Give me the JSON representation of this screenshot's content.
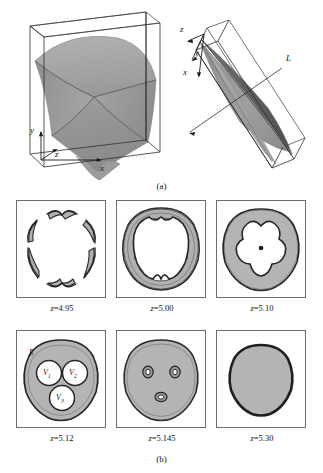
{
  "figure": {
    "panels": [
      {
        "id": "panel-a",
        "caption": "(a)"
      },
      {
        "id": "panel-b",
        "caption": "(b)"
      }
    ]
  },
  "panel_a": {
    "caption": "(a)",
    "left_render": {
      "name": "three-dimensional-surface-box-left",
      "axes": [
        {
          "label": "y",
          "direction": "up"
        },
        {
          "label": "z",
          "direction": "depth"
        },
        {
          "label": "x",
          "direction": "right"
        }
      ]
    },
    "right_render": {
      "name": "three-dimensional-surface-box-right",
      "axes": [
        {
          "label": "z",
          "direction": "up"
        },
        {
          "label": "y",
          "direction": "depth"
        },
        {
          "label": "x",
          "direction": "down"
        }
      ],
      "annotations": [
        {
          "label": "L",
          "name": "line-L"
        }
      ]
    }
  },
  "panel_b": {
    "caption": "(b)",
    "cross_sections": [
      {
        "id": "cs-1",
        "z_prefix": "z",
        "z_value": "=4.95",
        "label": "z=4.95",
        "description": "six separate crescent arcs arranged around a circle"
      },
      {
        "id": "cs-2",
        "z_prefix": "z",
        "z_value": "=5.00",
        "label": "z=5.00",
        "description": "connected annular ring with trilobal inner boundary"
      },
      {
        "id": "cs-3",
        "z_prefix": "z",
        "z_value": "=5.10",
        "label": "z=5.10",
        "description": "thick annulus with trefoil inner hole and central point"
      },
      {
        "id": "cs-4",
        "z_prefix": "z",
        "z_value": "=5.12",
        "label": "z=5.12",
        "description": "filled shield region with three circular voids",
        "regions": [
          {
            "label": "E",
            "name": "region-E"
          },
          {
            "label": "V",
            "sub": "1",
            "name": "region-V1"
          },
          {
            "label": "V",
            "sub": "2",
            "name": "region-V2"
          },
          {
            "label": "V",
            "sub": "3",
            "name": "region-V3"
          }
        ]
      },
      {
        "id": "cs-5",
        "z_prefix": "z",
        "z_value": "=5.145",
        "label": "z=5.145",
        "description": "filled shield region with three small shrinking rings"
      },
      {
        "id": "cs-6",
        "z_prefix": "z",
        "z_value": "=5.30",
        "label": "z=5.30",
        "description": "solid filled shield region, no voids"
      }
    ]
  },
  "colors": {
    "surface_light": "#a8a8a8",
    "surface_mid": "#8e8e8e",
    "surface_dark": "#6a6a6a",
    "surface_darkest": "#4a4a4a",
    "fill_gray": "#b4b4b4",
    "outline": "#2b2b2b",
    "box_line": "#3a3a3a",
    "frame": "#6d6d6d",
    "background": "#ffffff"
  }
}
